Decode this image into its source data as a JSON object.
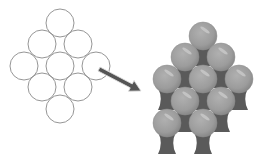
{
  "diagram": {
    "title": "",
    "colors": {
      "background": "#ffffff",
      "circle_stroke": "#8a8a8a",
      "arrow_fill": "#555555",
      "arrow_outline": "#dddddd",
      "sphere_fill": "#9c9c9c",
      "sphere_shade": "#8a8a8a",
      "sphere_highlight": "#c8c8c8",
      "neck_fill": "#5a5a5a"
    },
    "left_circles": {
      "radius": 14,
      "centers": [
        [
          60,
          23
        ],
        [
          42,
          44
        ],
        [
          78,
          44
        ],
        [
          24,
          66
        ],
        [
          60,
          66
        ],
        [
          96,
          66
        ],
        [
          42,
          87
        ],
        [
          78,
          87
        ],
        [
          60,
          109
        ]
      ]
    },
    "arrow": {
      "from": [
        99,
        69
      ],
      "to": [
        141,
        91
      ],
      "icon": "arrow-right-down-icon"
    },
    "right_spheres": {
      "radius": 14,
      "centers": [
        [
          203,
          36
        ],
        [
          185,
          57
        ],
        [
          221,
          57
        ],
        [
          167,
          79
        ],
        [
          203,
          79
        ],
        [
          239,
          79
        ],
        [
          185,
          101
        ],
        [
          221,
          101
        ],
        [
          167,
          123
        ],
        [
          203,
          123
        ]
      ]
    },
    "necks": [
      [
        203,
        55
      ],
      [
        185,
        77
      ],
      [
        221,
        77
      ],
      [
        167,
        99
      ],
      [
        203,
        99
      ],
      [
        239,
        99
      ],
      [
        185,
        121
      ],
      [
        221,
        121
      ],
      [
        167,
        143
      ],
      [
        203,
        143
      ]
    ]
  }
}
